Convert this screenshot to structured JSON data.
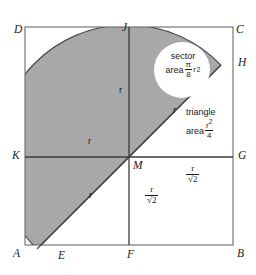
{
  "figure": {
    "colors": {
      "shade": "#a8a8a8",
      "stroke": "#4a4a4a",
      "text": "#1a1a1a",
      "background": "#ffffff",
      "cutout": "#ffffff"
    },
    "vertices": [
      {
        "id": "D",
        "label": "D",
        "position": "top-left"
      },
      {
        "id": "J",
        "label": "J",
        "position": "top-middle"
      },
      {
        "id": "C",
        "label": "C",
        "position": "top-right"
      },
      {
        "id": "H",
        "label": "H",
        "position": "right-upper"
      },
      {
        "id": "K",
        "label": "K",
        "position": "left-middle"
      },
      {
        "id": "M",
        "label": "M",
        "position": "center"
      },
      {
        "id": "G",
        "label": "G",
        "position": "right-middle"
      },
      {
        "id": "A",
        "label": "A",
        "position": "bottom-left"
      },
      {
        "id": "E",
        "label": "E",
        "position": "bottom-left-arc"
      },
      {
        "id": "F",
        "label": "F",
        "position": "bottom-middle"
      },
      {
        "id": "B",
        "label": "B",
        "position": "bottom-right"
      }
    ],
    "radius_labels": [
      {
        "id": "r-vert-top",
        "text": "r"
      },
      {
        "id": "r-horiz-left",
        "text": "r"
      },
      {
        "id": "r-diag-upper",
        "text": "r"
      },
      {
        "id": "r-diag-lower",
        "text": "r"
      }
    ],
    "sector_callout": {
      "line1": "sector",
      "line2_prefix": "area",
      "numerator": "π",
      "denominator": "8",
      "variable": "r",
      "exponent": "2"
    },
    "triangle_callout": {
      "line1": "triangle",
      "line2_prefix": "area",
      "numerator": "r",
      "numerator_exponent": "2",
      "denominator": "4"
    },
    "segment_labels": {
      "horizontal": {
        "numerator": "r",
        "denominator": "√2"
      },
      "vertical": {
        "numerator": "r",
        "denominator": "√2"
      }
    }
  }
}
